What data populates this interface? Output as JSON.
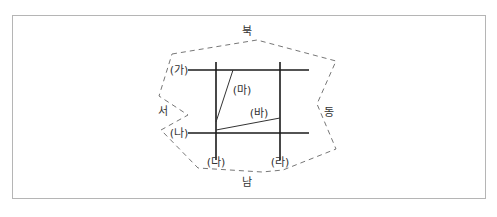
{
  "diagram": {
    "directions": {
      "north": "북",
      "south": "남",
      "east": "동",
      "west": "서"
    },
    "lines": {
      "ga": "(가)",
      "na": "(나)",
      "da": "(다)",
      "ra": "(라)",
      "ma": "(마)",
      "ba": "(바)"
    },
    "colors": {
      "lines": "#1a1a1a",
      "dashed_boundary": "#777777",
      "border": "#b5b5b5"
    }
  }
}
